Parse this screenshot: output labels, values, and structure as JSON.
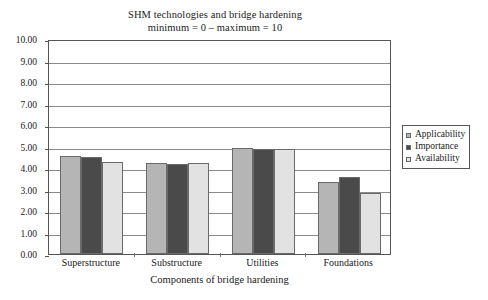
{
  "chart_data": {
    "type": "bar",
    "title": "SHM technologies and bridge hardening",
    "subtitle": "minimum = 0 – maximum = 10",
    "xlabel": "Components of bridge hardening",
    "ylabel": "",
    "ylim": [
      0,
      10
    ],
    "ytick_step": 1,
    "grid": true,
    "legend_position": "right",
    "categories": [
      "Superstructure",
      "Substructure",
      "Utilities",
      "Foundations"
    ],
    "ytick_labels": [
      "0.00",
      "1.00",
      "2.00",
      "3.00",
      "4.00",
      "5.00",
      "6.00",
      "7.00",
      "8.00",
      "9.00",
      "10.00"
    ],
    "series": [
      {
        "name": "Applicability",
        "color": "#b5b5b5",
        "values": [
          4.58,
          4.22,
          4.92,
          3.35
        ]
      },
      {
        "name": "Importance",
        "color": "#4a4a4a",
        "values": [
          4.5,
          4.17,
          4.88,
          3.57
        ]
      },
      {
        "name": "Availability",
        "color": "#e2e2e2",
        "values": [
          4.27,
          4.22,
          4.87,
          2.85
        ]
      }
    ]
  },
  "title": {
    "line1": "SHM technologies and bridge hardening",
    "line2": "minimum = 0 – maximum = 10"
  },
  "axes": {
    "x_title": "Components of bridge hardening"
  },
  "legend": {
    "items": [
      {
        "label": "Applicability"
      },
      {
        "label": "Importance"
      },
      {
        "label": "Availability"
      }
    ]
  },
  "colors": {
    "applicability": "#b5b5b5",
    "importance": "#4a4a4a",
    "availability": "#e2e2e2",
    "grid": "#8a8a8a",
    "frame": "#555555",
    "text": "#1a1a1a"
  }
}
